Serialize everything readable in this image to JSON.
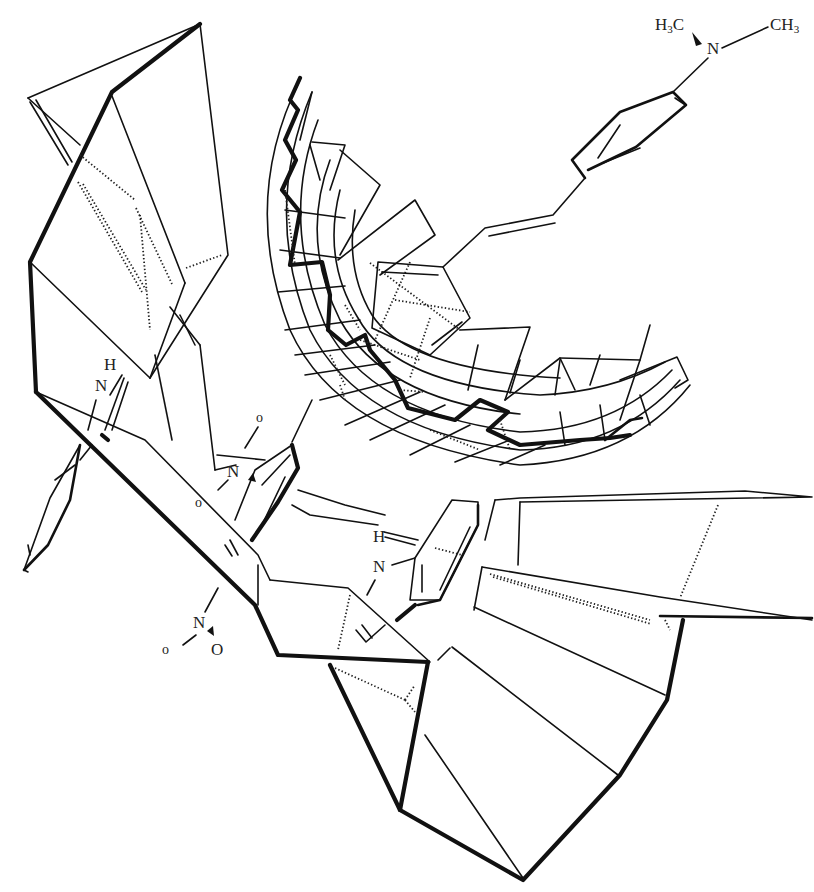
{
  "figure": {
    "type": "molecular host-guest complex line drawing",
    "colors": {
      "stroke": "#111111",
      "background": "#ffffff"
    }
  },
  "labels": {
    "dimethylamino": {
      "left_methyl": "H3C",
      "nitrogen": "N",
      "right_methyl": "CH3"
    },
    "indole_nh_left": {
      "h": "H",
      "n": "N"
    },
    "nitro_upper": {
      "o_top": "o",
      "n": "N",
      "o_bottom": "o"
    },
    "indole_nh_center": {
      "h": "H",
      "n": "N"
    },
    "nitro_lower": {
      "n": "N",
      "o_left": "o",
      "o_right": "O"
    }
  },
  "components": [
    {
      "name": "left-host-wall",
      "description": "folded planar cleft wall, upper left"
    },
    {
      "name": "curved-mesh-surface",
      "description": "bowl-shaped grid surface, center-top"
    },
    {
      "name": "dimethylaminostyryl-guest",
      "description": "stilbene guest with NMe2 group"
    },
    {
      "name": "indole-left",
      "description": "indole N-H near left wall"
    },
    {
      "name": "indole-center",
      "description": "indole N-H at center"
    },
    {
      "name": "right-host-wall",
      "description": "stepped planar wall, lower right"
    }
  ]
}
